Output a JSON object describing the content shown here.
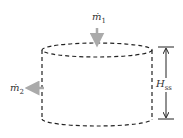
{
  "diagram": {
    "type": "control-volume-cylinder",
    "inflow_label": {
      "symbol": "ṁ",
      "subscript": "1"
    },
    "outflow_label": {
      "symbol": "ṁ",
      "subscript": "2"
    },
    "height_label": {
      "symbol": "H",
      "subscript": "ss"
    },
    "colors": {
      "outline": "#222222",
      "flow_arrow": "#aaaaaa",
      "dimension_arrow": "#222222"
    }
  }
}
